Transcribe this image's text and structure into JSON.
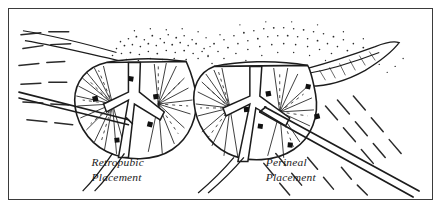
{
  "figure": {
    "border_color": "#3b3b3b",
    "background_color": "#ffffff",
    "ink_color": "#1c1c1c",
    "stipple_color": "#2a2a2a",
    "width": 442,
    "height": 210
  },
  "panels": [
    {
      "id": "retropubic",
      "caption_line1": "Retropubic",
      "caption_line2": "Placement",
      "caption_x": 83,
      "caption_y": 160,
      "needle_approach": "horizontal-from-left",
      "seed_count": 5,
      "seeds": [
        {
          "x": 90,
          "y": 93,
          "w": 5,
          "h": 5
        },
        {
          "x": 126,
          "y": 74,
          "w": 5,
          "h": 5
        },
        {
          "x": 151,
          "y": 92,
          "w": 5,
          "h": 5
        },
        {
          "x": 145,
          "y": 120,
          "w": 5,
          "h": 5
        },
        {
          "x": 112,
          "y": 136,
          "w": 5,
          "h": 5
        }
      ]
    },
    {
      "id": "perineal",
      "caption_line1": "Perineal",
      "caption_line2": "Placement",
      "caption_x": 258,
      "caption_y": 160,
      "needle_approach": "diagonal-from-lower-right",
      "seed_count": 6,
      "seeds": [
        {
          "x": 265,
          "y": 89,
          "w": 5,
          "h": 5
        },
        {
          "x": 304,
          "y": 82,
          "w": 5,
          "h": 5
        },
        {
          "x": 243,
          "y": 105,
          "w": 5,
          "h": 5
        },
        {
          "x": 256,
          "y": 122,
          "w": 5,
          "h": 5
        },
        {
          "x": 313,
          "y": 112,
          "w": 5,
          "h": 5
        },
        {
          "x": 286,
          "y": 141,
          "w": 5,
          "h": 5
        }
      ]
    }
  ],
  "anatomy_labels": {
    "gland": "prostate-gland",
    "urethra": "urethra",
    "ducts": "ejaculatory-ducts",
    "fat": "periprostatic-fat-stipple",
    "needle": "implant-needle",
    "tissue_planes": "dashed-tissue-planes",
    "seminal_vesicle": "seminal-vesicle"
  }
}
